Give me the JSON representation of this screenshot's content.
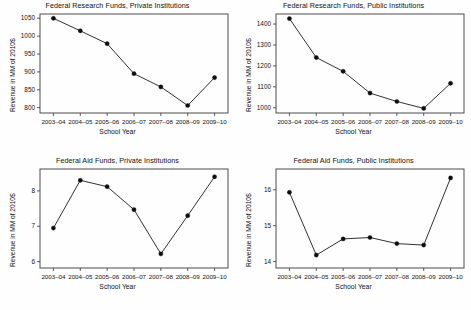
{
  "figure": {
    "width": 471,
    "height": 310,
    "background": "#ffffff",
    "line_color": "#1a1a1a",
    "marker_color": "#0d0d0d",
    "frame_color": "#4d4d4d"
  },
  "common": {
    "xlabel": "School Year",
    "ylabel": "Revenue in MM of 2010$",
    "categories": [
      "2003–04",
      "2004–05",
      "2005–06",
      "2006–07",
      "2007–08",
      "2008–09",
      "2009–10"
    ]
  },
  "chart_data": [
    {
      "id": "research-private",
      "type": "line",
      "title": "Federal Research Funds, Private Institutions",
      "xlabel": "School Year",
      "ylabel": "Revenue in MM of 2010$",
      "categories": [
        "2003–04",
        "2004–05",
        "2005–06",
        "2006–07",
        "2007–08",
        "2008–09",
        "2009–10"
      ],
      "values": [
        1050,
        1015,
        979,
        895,
        858,
        806,
        884
      ],
      "yticks": [
        800,
        850,
        900,
        950,
        1000,
        1050
      ],
      "ytick_labels": [
        "800",
        "850",
        "900",
        "950",
        "1000",
        "1050"
      ],
      "ylim": [
        785,
        1062
      ],
      "grid": false,
      "legend": "none",
      "markers": true
    },
    {
      "id": "research-public",
      "type": "line",
      "title": "Federal Research Funds, Public Institutions",
      "xlabel": "School Year",
      "ylabel": "Revenue in MM of 2010$",
      "categories": [
        "2003–04",
        "2004–05",
        "2005–06",
        "2006–07",
        "2007–08",
        "2008–09",
        "2009–10"
      ],
      "values": [
        1426,
        1240,
        1174,
        1070,
        1030,
        997,
        1117
      ],
      "yticks": [
        1000,
        1100,
        1200,
        1300,
        1400
      ],
      "ytick_labels": [
        "1000",
        "1100",
        "1200",
        "1300",
        "1400"
      ],
      "ylim": [
        975,
        1448
      ],
      "grid": false,
      "legend": "none",
      "markers": true
    },
    {
      "id": "aid-private",
      "type": "line",
      "title": "Federal Aid Funds, Private Institutions",
      "xlabel": "School Year",
      "ylabel": "Revenue in MM of 2010$",
      "categories": [
        "2003–04",
        "2004–05",
        "2005–06",
        "2006–07",
        "2007–08",
        "2008–09",
        "2009–10"
      ],
      "values": [
        6.95,
        8.3,
        8.12,
        7.47,
        6.22,
        7.3,
        8.4
      ],
      "yticks": [
        6,
        7,
        8
      ],
      "ytick_labels": [
        "6",
        "7",
        "8"
      ],
      "ylim": [
        5.82,
        8.62
      ],
      "grid": false,
      "legend": "none",
      "markers": true
    },
    {
      "id": "aid-public",
      "type": "line",
      "title": "Federal Aid Funds, Public Institutions",
      "xlabel": "School Year",
      "ylabel": "Revenue in MM of 2010$",
      "categories": [
        "2003–04",
        "2004–05",
        "2005–06",
        "2006–07",
        "2007–08",
        "2008–09",
        "2009–10"
      ],
      "values": [
        15.93,
        14.18,
        14.63,
        14.67,
        14.5,
        14.46,
        16.33
      ],
      "yticks": [
        14,
        15,
        16
      ],
      "ytick_labels": [
        "14",
        "15",
        "16"
      ],
      "ylim": [
        13.82,
        16.58
      ],
      "grid": false,
      "legend": "none",
      "markers": true
    }
  ]
}
